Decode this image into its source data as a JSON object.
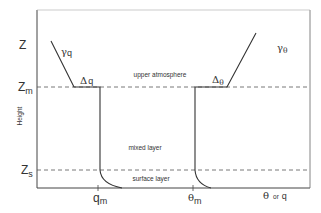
{
  "diagram": {
    "title": "",
    "y_axis_label": "Height",
    "x_axis_label": {
      "theta": "θ",
      "or": "or",
      "q": "q"
    },
    "height_levels": {
      "z": "Z",
      "zm": {
        "base": "Z",
        "sub": "m"
      },
      "zs": {
        "base": "Z",
        "sub": "s"
      }
    },
    "x_ticks": {
      "qm": {
        "base": "q",
        "sub": "m"
      },
      "theta_m": {
        "base": "θ",
        "sub": "m"
      }
    },
    "layers": {
      "upper": "upper atmosphere",
      "mixed": "mixed layer",
      "surface": "surface layer"
    },
    "profile_labels": {
      "gamma_q": {
        "base": "γ",
        "sub": "q"
      },
      "delta_q": {
        "base": "Δ",
        "sub": "q"
      },
      "gamma_theta": {
        "base": "γ",
        "sub": "θ"
      },
      "delta_theta": {
        "base": "Δ",
        "sub": "θ"
      }
    },
    "colors": {
      "line": "#333333",
      "background": "#ffffff"
    }
  }
}
